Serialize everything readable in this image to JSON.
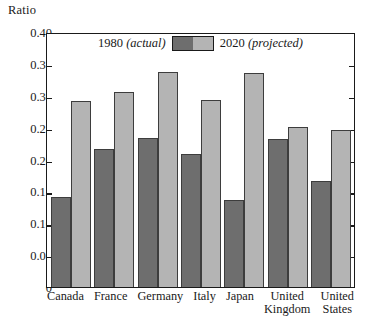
{
  "chart_data": {
    "type": "bar",
    "title": "",
    "ylabel": "Ratio",
    "xlabel": "",
    "ylim": [
      0,
      0.4
    ],
    "ytick_labels": [
      "0.40",
      "0.35",
      "0.30",
      "0.25",
      "0.20",
      "0.15",
      "0.10",
      "0.05",
      "0"
    ],
    "ytick_values": [
      0.4,
      0.35,
      0.3,
      0.25,
      0.2,
      0.15,
      0.1,
      0.05,
      0
    ],
    "grid": false,
    "legend_position": "top-center",
    "categories": [
      "Canada",
      "France",
      "Germany",
      "Italy",
      "Japan",
      "United Kingdom",
      "United States"
    ],
    "category_lines": [
      {
        "line1": "Canada",
        "line2": ""
      },
      {
        "line1": "France",
        "line2": ""
      },
      {
        "line1": "Germany",
        "line2": ""
      },
      {
        "line1": "Italy",
        "line2": ""
      },
      {
        "line1": "Japan",
        "line2": ""
      },
      {
        "line1": "United",
        "line2": "Kingdom"
      },
      {
        "line1": "United",
        "line2": "States"
      }
    ],
    "series": [
      {
        "name": "1980 (actual)",
        "name_main": "1980",
        "name_paren": "(actual)",
        "color": "#6e6e6e",
        "values": [
          0.141,
          0.216,
          0.233,
          0.209,
          0.136,
          0.232,
          0.166
        ]
      },
      {
        "name": "2020 (projected)",
        "name_main": "2020",
        "name_paren": "(projected)",
        "color": "#b4b4b4",
        "values": [
          0.292,
          0.306,
          0.337,
          0.293,
          0.335,
          0.251,
          0.247
        ]
      }
    ]
  },
  "legend": {
    "actual_main": "1980",
    "actual_paren": "(actual)",
    "projected_main": "2020",
    "projected_paren": "(projected)"
  },
  "colors": {
    "actual": "#6e6e6e",
    "projected": "#b4b4b4",
    "axis": "#1a1a1a",
    "background": "#ffffff"
  }
}
